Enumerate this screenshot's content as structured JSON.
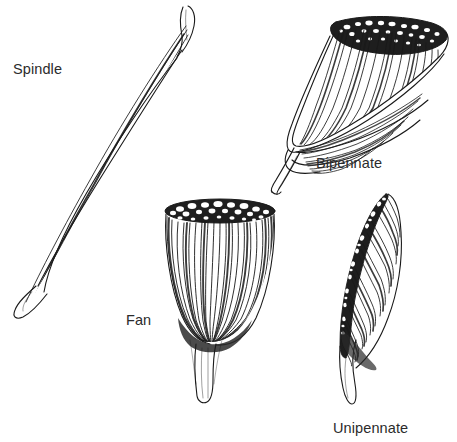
{
  "figure": {
    "background_color": "#ffffff",
    "ink_color": "#1a1a1a",
    "label_color": "#2b2b2b",
    "width": 457,
    "height": 442
  },
  "labels": {
    "spindle": "Spindle",
    "bipennate": "Bipennate",
    "fan": "Fan",
    "unipennate": "Unipennate"
  },
  "illustrations": [
    {
      "name": "spindle-muscle",
      "label": "Spindle",
      "description": "Elongated fusiform muscle belly oriented diagonally from lower-left to upper-right, with tapered tendons at both ends and long parallel fibers."
    },
    {
      "name": "bipennate-muscle",
      "label": "Bipennate",
      "description": "Muscle with a stippled bone attachment along the upper border and fibers converging obliquely from both sides onto a central tendon that extends down to the lower left."
    },
    {
      "name": "fan-muscle",
      "label": "Fan",
      "description": "Triangular fan-shaped muscle with a broad stippled bone attachment across the top and fibers converging downward into a single narrow tendon."
    },
    {
      "name": "unipennate-muscle",
      "label": "Unipennate",
      "description": "Muscle with a stippled attachment along one oblique border and fibers running in one direction to a tendon along the opposite border that continues downward."
    }
  ]
}
